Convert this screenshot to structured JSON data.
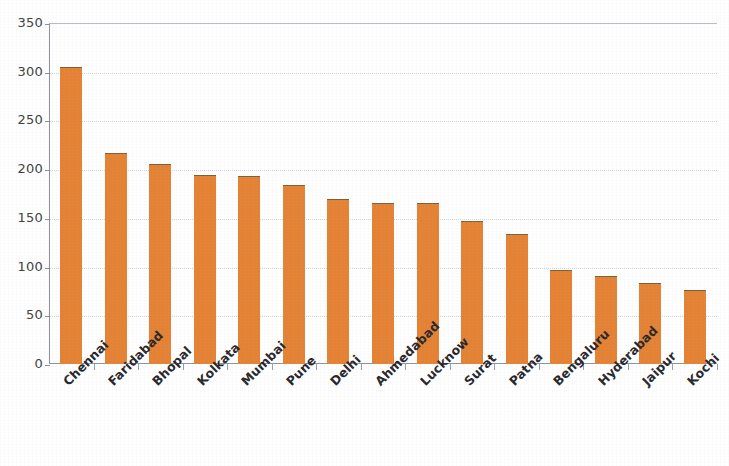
{
  "chart_data": {
    "type": "bar",
    "title": "",
    "subtitle": "",
    "xlabel": "",
    "ylabel": "",
    "ylim": [
      0,
      350
    ],
    "ytick_interval": 50,
    "ytick_labels": [
      "0",
      "50",
      "100",
      "150",
      "200",
      "250",
      "300",
      "350"
    ],
    "ytick_values": [
      0,
      50,
      100,
      150,
      200,
      250,
      300,
      350
    ],
    "grid": true,
    "grid_axis": "y",
    "legend": false,
    "legend_position": "none",
    "bar_color": "#e58132",
    "bar_edge_color": "#73623a",
    "axis_color": "#8e9199",
    "gridline_color": "#d3d6dd",
    "label_rotation_degrees": -45,
    "categories": [
      "Chennai",
      "Faridabad",
      "Bhopal",
      "Kolkata",
      "Mumbai",
      "Pune",
      "Delhi",
      "Ahmedabad",
      "Lucknow",
      "Surat",
      "Patna",
      "Bengaluru",
      "Hyderabad",
      "Jaipur",
      "Kochi"
    ],
    "values": [
      305,
      217,
      205,
      194,
      193,
      184,
      169,
      165,
      165,
      147,
      133,
      97,
      90,
      83,
      76
    ]
  }
}
